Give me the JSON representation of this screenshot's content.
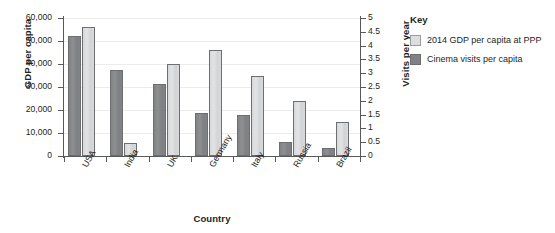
{
  "chart_data": {
    "type": "bar",
    "title": "",
    "xlabel": "Country",
    "categories": [
      "USA",
      "India",
      "UK",
      "Germany",
      "Italy",
      "Russia",
      "Brazil"
    ],
    "series": [
      {
        "name": "Cinema visits per capita",
        "axis": "right",
        "color": "#808285",
        "values": [
          4.35,
          3.1,
          2.6,
          1.55,
          1.5,
          0.5,
          0.3
        ]
      },
      {
        "name": "2014 GDP per capita at PPP",
        "axis": "left",
        "color": "#dcdddd",
        "values": [
          56000,
          5500,
          40000,
          46000,
          35000,
          24000,
          15000
        ]
      }
    ],
    "y_left": {
      "label": "GDP per capita",
      "ticks": [
        "0",
        "10,000",
        "20,000",
        "30,000",
        "40,000",
        "50,000",
        "60,000"
      ],
      "values": [
        0,
        10000,
        20000,
        30000,
        40000,
        50000,
        60000
      ],
      "ylim": [
        0,
        60000
      ]
    },
    "y_right": {
      "label": "Visits per year",
      "ticks": [
        "0",
        "0.5",
        "1",
        "1.5",
        "2",
        "2.5",
        "3",
        "3.5",
        "4",
        "4.5",
        "5"
      ],
      "values": [
        0,
        0.5,
        1,
        1.5,
        2,
        2.5,
        3,
        3.5,
        4,
        4.5,
        5
      ],
      "ylim": [
        0,
        5
      ]
    },
    "grid": true,
    "legend_position": "right"
  },
  "legend": {
    "title": "Key",
    "items": [
      {
        "label": "2014 GDP per capita at PPP",
        "swatch": "light"
      },
      {
        "label": "Cinema visits per capita",
        "swatch": "dark"
      }
    ]
  }
}
